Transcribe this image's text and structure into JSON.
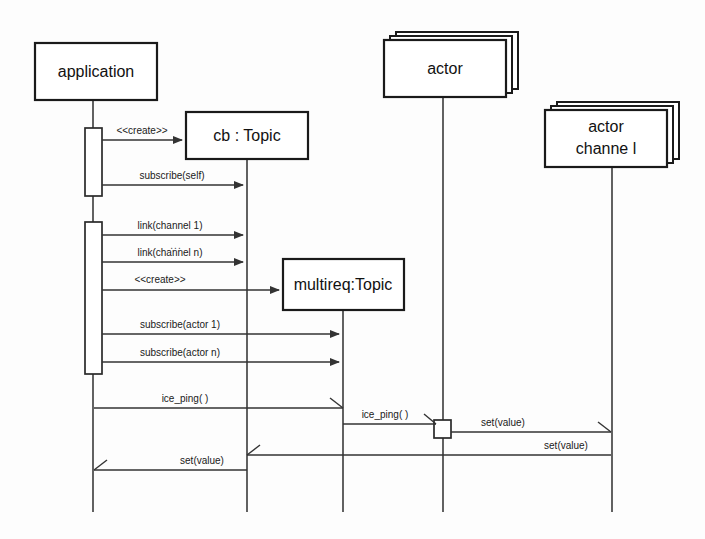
{
  "diagram": {
    "type": "sequence",
    "background_color": "#fdfdfd",
    "line_color": "#333333",
    "box_fill": "#ffffff"
  },
  "participants": [
    {
      "id": "application",
      "label": "application",
      "multi_instance": false,
      "lifeline_x": 93,
      "box": {
        "x": 35,
        "y": 43,
        "w": 122,
        "h": 57
      }
    },
    {
      "id": "cb_topic",
      "label": "cb : Topic",
      "multi_instance": false,
      "lifeline_x": 247,
      "box": {
        "x": 186,
        "y": 112,
        "w": 122,
        "h": 47
      }
    },
    {
      "id": "multireq_topic",
      "label": "multireq:Topic",
      "multi_instance": false,
      "lifeline_x": 343,
      "box": {
        "x": 283,
        "y": 259,
        "w": 121,
        "h": 51
      }
    },
    {
      "id": "actor",
      "label": "actor",
      "multi_instance": true,
      "lifeline_x": 443,
      "box": {
        "x": 384,
        "y": 40,
        "w": 122,
        "h": 57
      }
    },
    {
      "id": "actor_channel",
      "label_line1": "actor",
      "label_line2": "channe  l",
      "multi_instance": true,
      "lifeline_x": 612,
      "box": {
        "x": 545,
        "y": 110,
        "w": 122,
        "h": 57
      }
    }
  ],
  "activations": [
    {
      "id": "app-act-1",
      "participant": "application",
      "x": 85,
      "y": 128,
      "w": 17,
      "h": 68
    },
    {
      "id": "app-act-2",
      "participant": "application",
      "x": 85,
      "y": 222,
      "w": 17,
      "h": 152
    },
    {
      "id": "actor-act-1",
      "participant": "actor",
      "x": 434,
      "y": 420,
      "w": 17,
      "h": 18
    }
  ],
  "messages": [
    {
      "id": "m1",
      "label": "<<create>>",
      "from_x": 102,
      "to_x": 186,
      "y": 140,
      "direction": "right",
      "arrow": "solid"
    },
    {
      "id": "m2",
      "label": "subscribe(self)",
      "from_x": 102,
      "to_x": 246,
      "y": 185,
      "direction": "right",
      "arrow": "solid"
    },
    {
      "id": "m3",
      "label": "link(channel 1)",
      "from_x": 102,
      "to_x": 246,
      "y": 235,
      "direction": "right",
      "arrow": "solid"
    },
    {
      "id": "m-ellipsis",
      "label": "...",
      "from_x": 102,
      "to_x": 246,
      "y": 245,
      "direction": "none",
      "arrow": "none"
    },
    {
      "id": "m4",
      "label": "link(channel n)",
      "from_x": 102,
      "to_x": 246,
      "y": 262,
      "direction": "right",
      "arrow": "solid"
    },
    {
      "id": "m5",
      "label": "<<create>>",
      "from_x": 102,
      "to_x": 282,
      "y": 290,
      "direction": "right",
      "arrow": "solid"
    },
    {
      "id": "m6",
      "label": "subscribe(actor 1)",
      "from_x": 102,
      "to_x": 342,
      "y": 334,
      "direction": "right",
      "arrow": "solid"
    },
    {
      "id": "m7",
      "label": "subscribe(actor n)",
      "from_x": 102,
      "to_x": 342,
      "y": 362,
      "direction": "right",
      "arrow": "solid"
    },
    {
      "id": "m8",
      "label": "ice_ping( )",
      "from_x": 94,
      "to_x": 343,
      "y": 408,
      "direction": "right",
      "arrow": "half"
    },
    {
      "id": "m9",
      "label": "ice_ping( )",
      "from_x": 343,
      "to_x": 434,
      "y": 424,
      "direction": "right",
      "arrow": "half"
    },
    {
      "id": "m10",
      "label": "set(value)",
      "from_x": 451,
      "to_x": 611,
      "y": 432,
      "direction": "right",
      "arrow": "half"
    },
    {
      "id": "m11",
      "label": "set(value)",
      "from_x": 611,
      "to_x": 247,
      "y": 455,
      "direction": "left",
      "arrow": "half"
    },
    {
      "id": "m12",
      "label": "set(value)",
      "from_x": 247,
      "to_x": 94,
      "y": 470,
      "direction": "left",
      "arrow": "half"
    }
  ],
  "lifeline_bottom_y": 512
}
